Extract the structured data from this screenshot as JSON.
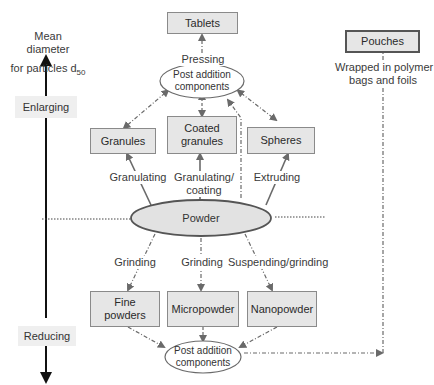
{
  "axis": {
    "title_line1": "Mean",
    "title_line2": "diameter",
    "title_line3": "for particles d",
    "title_subscript": "50",
    "up_label": "Enlarging",
    "down_label": "Reducing"
  },
  "nodes": {
    "tablets": "Tablets",
    "pouches": "Pouches",
    "post_addition_top_line1": "Post addition",
    "post_addition_top_line2": "components",
    "granules": "Granules",
    "coated_granules_line1": "Coated",
    "coated_granules_line2": "granules",
    "spheres": "Spheres",
    "powder": "Powder",
    "fine_powders_line1": "Fine",
    "fine_powders_line2": "powders",
    "micropowder": "Micropowder",
    "nanopowder": "Nanopowder",
    "post_addition_bottom_line1": "Post addition",
    "post_addition_bottom_line2": "components"
  },
  "edges": {
    "pressing": "Pressing",
    "wrapped_line1": "Wrapped in polymer",
    "wrapped_line2": "bags and foils",
    "granulating": "Granulating",
    "granulating_coating_line1": "Granulating/",
    "granulating_coating_line2": "coating",
    "extruding": "Extruding",
    "grinding_left": "Grinding",
    "grinding_center": "Grinding",
    "suspending_grinding": "Suspending/grinding"
  }
}
